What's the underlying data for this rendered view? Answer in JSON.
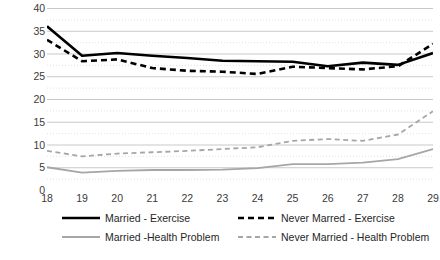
{
  "chart_data": {
    "type": "line",
    "title": "",
    "subtitle": "",
    "xlabel": "",
    "ylabel": "",
    "x": [
      18,
      19,
      20,
      21,
      22,
      23,
      24,
      25,
      26,
      27,
      28,
      29
    ],
    "xlim": [
      18,
      29
    ],
    "ylim": [
      0,
      40
    ],
    "ytick_values": [
      0,
      5,
      10,
      15,
      20,
      25,
      30,
      35,
      40
    ],
    "ytick_labels": [
      "0",
      "5",
      "10",
      "15",
      "20",
      "25",
      "30",
      "35",
      "40"
    ],
    "xtick_labels": [
      "18",
      "19",
      "20",
      "21",
      "22",
      "23",
      "24",
      "25",
      "26",
      "27",
      "28",
      "29"
    ],
    "grid": true,
    "grid_axis": "y",
    "legend_position": "bottom",
    "series": [
      {
        "name": "Married - Exercise",
        "color": "#000000",
        "style": "solid",
        "width": 2.6,
        "values": [
          36.0,
          29.5,
          30.1,
          29.5,
          29.0,
          28.4,
          28.3,
          28.2,
          27.2,
          28.0,
          27.5,
          30.1
        ]
      },
      {
        "name": "Never Marred - Exercise",
        "color": "#000000",
        "style": "dashed",
        "width": 2.6,
        "values": [
          33.0,
          28.3,
          28.7,
          26.8,
          26.2,
          26.0,
          25.5,
          27.1,
          26.8,
          26.5,
          27.2,
          32.1
        ]
      },
      {
        "name": "Married -Health Problem",
        "color": "#a6a6a6",
        "style": "solid",
        "width": 1.8,
        "values": [
          5.0,
          3.8,
          4.2,
          4.4,
          4.4,
          4.5,
          4.8,
          5.7,
          5.7,
          6.0,
          6.8,
          9.0
        ]
      },
      {
        "name": "Never Married - Health Problem",
        "color": "#a6a6a6",
        "style": "dashed",
        "width": 1.8,
        "values": [
          8.6,
          7.4,
          8.0,
          8.3,
          8.6,
          9.0,
          9.4,
          10.8,
          11.2,
          10.8,
          12.2,
          17.3
        ]
      }
    ]
  },
  "legend": {
    "items": [
      {
        "label": "Married - Exercise",
        "color": "#000000",
        "style": "solid"
      },
      {
        "label": "Never Marred - Exercise",
        "color": "#000000",
        "style": "dashed"
      },
      {
        "label": "Married -Health Problem",
        "color": "#a6a6a6",
        "style": "solid"
      },
      {
        "label": "Never Married - Health Problem",
        "color": "#a6a6a6",
        "style": "dashed"
      }
    ]
  },
  "axis_colors": {
    "gridline": "#c9c9c9",
    "dotted_gridline": "#d9d9d9",
    "tick_text": "#3a3a3a"
  }
}
